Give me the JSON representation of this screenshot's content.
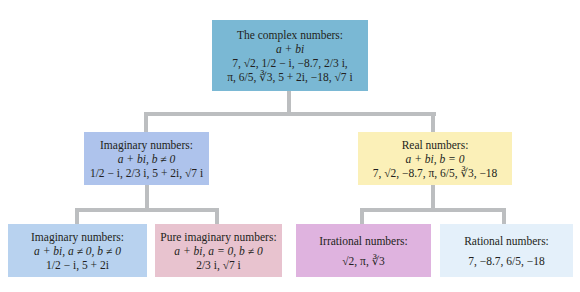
{
  "colors": {
    "connector": "#bcbec0",
    "root": "#7ab8d4",
    "imaginary": "#aec3ec",
    "real": "#fbf0b8",
    "imaginary_sub": "#b8d2ef",
    "pure_imaginary": "#e8c3cf",
    "irrational": "#dfb3df",
    "rational": "#e4f0fa"
  },
  "root": {
    "title": "The complex numbers:",
    "form": "a + bi",
    "examples_line1": "7, √2, 1/2 − i, −8.7, 2/3 i,",
    "examples_line2": "π, 6/5, ∛3, 5 + 2i, −18, √7 i"
  },
  "imaginary": {
    "title": "Imaginary numbers:",
    "form": "a + bi, b ≠ 0",
    "examples": "1/2 − i, 2/3 i, 5 + 2i, √7 i"
  },
  "real": {
    "title": "Real numbers:",
    "form": "a + bi, b = 0",
    "examples": "7, √2, −8.7, π, 6/5, ∛3, −18"
  },
  "imaginary_sub": {
    "title": "Imaginary numbers:",
    "form": "a + bi, a ≠ 0, b ≠ 0",
    "examples": "1/2 − i, 5 + 2i"
  },
  "pure_imaginary": {
    "title": "Pure imaginary numbers:",
    "form": "a + bi, a = 0, b ≠ 0",
    "examples": "2/3 i, √7 i"
  },
  "irrational": {
    "title": "Irrational numbers:",
    "examples": "√2, π, ∛3"
  },
  "rational": {
    "title": "Rational numbers:",
    "examples": "7, −8.7, 6/5, −18"
  }
}
